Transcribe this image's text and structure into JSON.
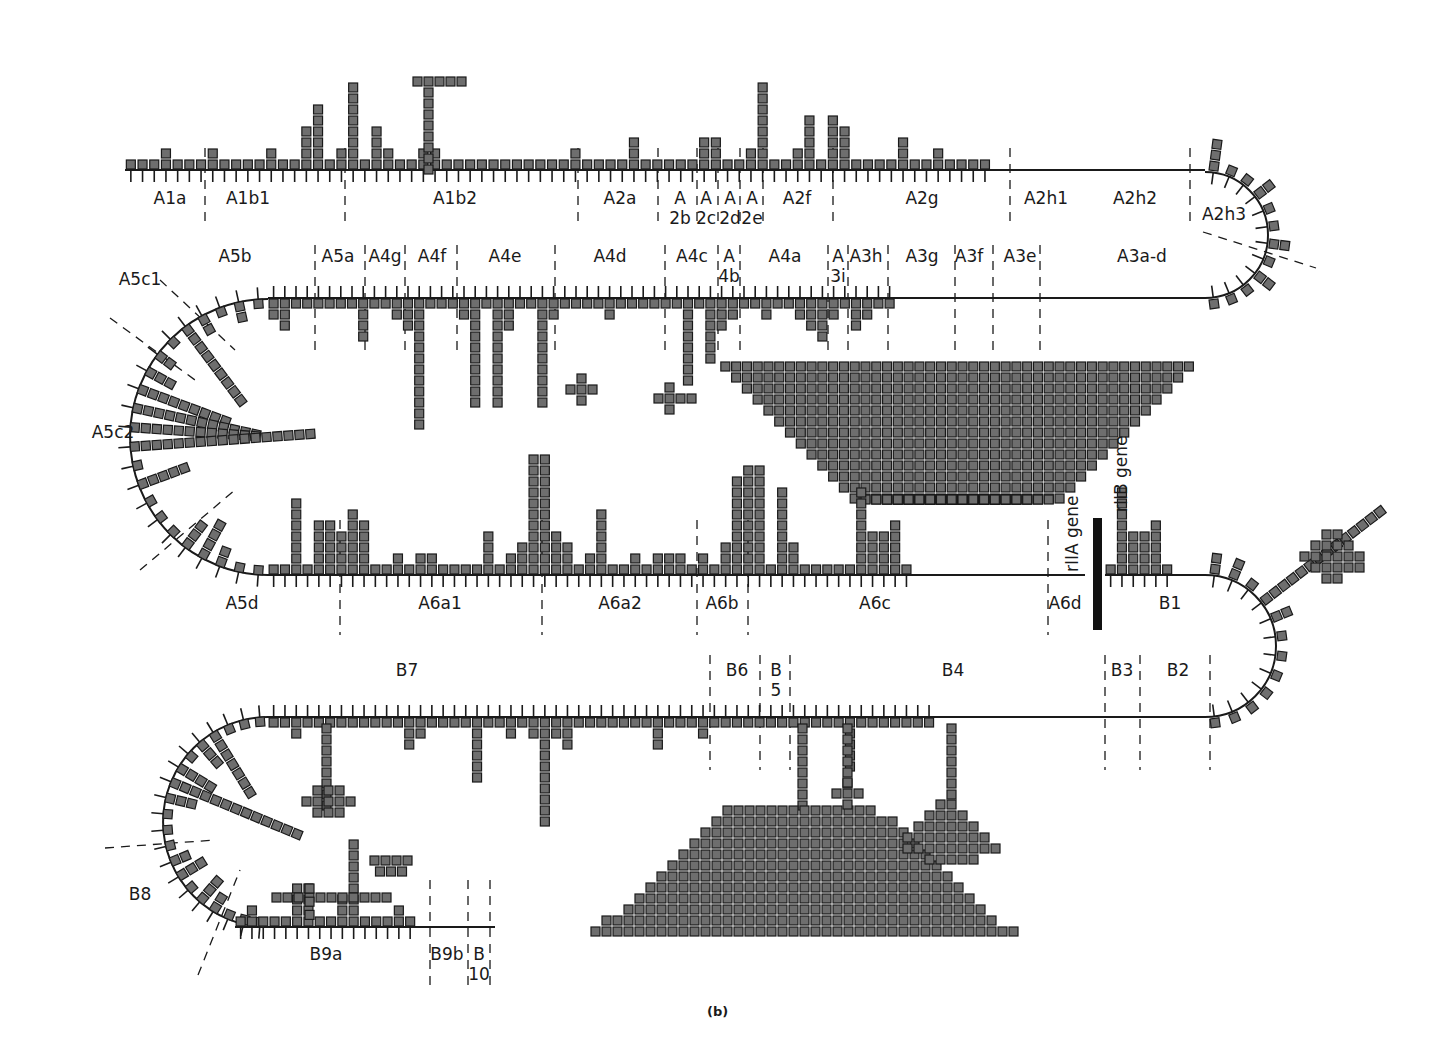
{
  "figure": {
    "caption": "(b)",
    "cell_color": "#6e6e6e",
    "line_color": "#1a1a1a",
    "gene_labels": {
      "rIIA": "rIIA gene",
      "rIIB": "rIIB gene"
    }
  },
  "segments": {
    "row1": [
      "A1a",
      "A1b1",
      "A1b2",
      "A2a",
      "A 2b",
      "A 2c",
      "A 2d",
      "A 2e",
      "A2f",
      "A2g",
      "A2h1",
      "A2h2",
      "A2h3"
    ],
    "row2": [
      "A5b",
      "A5a",
      "A4g",
      "A4f",
      "A4e",
      "A4d",
      "A4c",
      "A 4b",
      "A4a",
      "A 3i",
      "A3h",
      "A3g",
      "A3f",
      "A3e",
      "A3a-d",
      "A5c1",
      "A5c2"
    ],
    "row3": [
      "A5d",
      "A6a1",
      "A6a2",
      "A6b",
      "A6c",
      "A6d",
      "B1"
    ],
    "row4": [
      "B7",
      "B6",
      "B 5",
      "B4",
      "B3",
      "B2"
    ],
    "row5": [
      "B8",
      "B9a",
      "B9b",
      "B 10"
    ]
  },
  "chart_data": {
    "type": "bar",
    "subtitle": "(b)",
    "xlabel": "Deletion-mapped segments along rII locus",
    "ylabel": "Number of independent mutations at each site (one square per occurrence)",
    "rows": [
      {
        "name": "row1 (A1a to A2h3, bars upward)",
        "direction": "up",
        "segments": [
          "A1a",
          "A1b1",
          "A1b2",
          "A2a",
          "A2b",
          "A2c",
          "A2d",
          "A2e",
          "A2f",
          "A2g",
          "A2h1",
          "A2h2",
          "A2h3"
        ],
        "values": [
          1,
          1,
          1,
          2,
          1,
          1,
          1,
          2,
          1,
          1,
          1,
          1,
          2,
          1,
          1,
          4,
          6,
          1,
          2,
          "cap:T(5x13)",
          1,
          4,
          2,
          1,
          1,
          2,
          2,
          1,
          1,
          1,
          1,
          1,
          1,
          1,
          1,
          1,
          1,
          1,
          2,
          1,
          1,
          1,
          1,
          3,
          1,
          1,
          1,
          1,
          1,
          3,
          3,
          1,
          1,
          2,
          8,
          1,
          1,
          2,
          5,
          1,
          5,
          4,
          1,
          1,
          1,
          1,
          3,
          1,
          1,
          2,
          1,
          1,
          1,
          1
        ]
      },
      {
        "name": "row2 (A5b to A3a-d, bars downward)",
        "direction": "down",
        "segments": [
          "A5b",
          "A5a",
          "A4g",
          "A4f",
          "A4e",
          "A4d",
          "A4c",
          "A4b",
          "A4a",
          "A3i",
          "A3h",
          "A3g",
          "A3f",
          "A3e",
          "A3a-d"
        ],
        "values": [
          2,
          3,
          1,
          1,
          1,
          1,
          1,
          1,
          4,
          1,
          1,
          2,
          3,
          12,
          1,
          1,
          1,
          2,
          "cap:+(13)",
          1,
          10,
          3,
          1,
          1,
          "cap:+(15)",
          2,
          1,
          1,
          1,
          1,
          2,
          1,
          1,
          1,
          1,
          1,
          1,
          8,
          1,
          6,
          3,
          2,
          1,
          1,
          2,
          1,
          1,
          2,
          3,
          4,
          2,
          1,
          3,
          2,
          1,
          1
        ]
      },
      {
        "name": "row3 (A5d to B1, bars upward)",
        "direction": "up",
        "segments": [
          "A5d",
          "A6a1",
          "A6a2",
          "A6b",
          "A6c",
          "A6d",
          "B1"
        ],
        "values": [
          1,
          1,
          7,
          1,
          5,
          5,
          4,
          6,
          5,
          1,
          1,
          2,
          1,
          2,
          2,
          1,
          1,
          1,
          1,
          4,
          1,
          2,
          3,
          11,
          11,
          4,
          3,
          1,
          2,
          6,
          1,
          1,
          2,
          1,
          2,
          2,
          2,
          1,
          2,
          1,
          3,
          9,
          10,
          "cap:inverted-triangle(~26 wide)",
          1,
          8,
          3,
          1,
          1,
          1,
          1,
          1,
          8,
          4,
          4,
          5,
          1
        ]
      },
      {
        "name": "row4 (B7 to B2, bars downward)",
        "direction": "down",
        "segments": [
          "B7",
          "B6",
          "B5",
          "B4",
          "B3",
          "B2"
        ],
        "values": [
          1,
          1,
          2,
          1,
          "cap:diamond(~9 wide)",
          1,
          1,
          1,
          1,
          1,
          1,
          1,
          3,
          2,
          1,
          1,
          1,
          1,
          6,
          1,
          1,
          2,
          1,
          2,
          10,
          2,
          3,
          1,
          1,
          1,
          1,
          1,
          "cap:trapezoid(~27 wide)",
          1,
          3,
          "cap:+(4)",
          1,
          1,
          2,
          1,
          1,
          1,
          "cap:triangle(~13 wide)",
          1,
          1,
          1,
          1,
          1,
          1,
          1,
          1,
          5,
          1,
          1,
          1,
          1,
          1,
          1,
          1
        ]
      },
      {
        "name": "row5 (B8 to B10, bars upward)",
        "direction": "up",
        "segments": [
          "B8",
          "B9a",
          "B9b",
          "B10"
        ],
        "values": [
          1,
          2,
          1,
          1,
          1,
          "cap:T(11)",
          5,
          1,
          1,
          3,
          "cap:T(5)",
          1,
          1,
          1,
          2,
          1
        ]
      }
    ],
    "annotations": [
      "rIIA gene",
      "rIIB gene",
      "A5c1",
      "A5c2",
      "B8"
    ],
    "hotspots": [
      {
        "site": "A6c region (rIIA)",
        "shape": "inverted triangle",
        "approx_count": 500
      },
      {
        "site": "B4 region (rIIB)",
        "shape": "large trapezoid",
        "approx_count": 500
      },
      {
        "site": "A1b2",
        "shape": "T-cap",
        "approx_count": 17
      },
      {
        "site": "B1 (curved)",
        "shape": "club",
        "approx_count": 30
      }
    ],
    "grid": false,
    "legend": null
  }
}
